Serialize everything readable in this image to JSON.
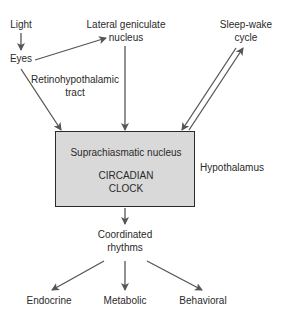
{
  "diagram": {
    "nodes": {
      "light": "Light",
      "eyes": "Eyes",
      "lgn_line1": "Lateral geniculate",
      "lgn_line2": "nucleus",
      "sleep_line1": "Sleep-wake",
      "sleep_line2": "cycle",
      "rht_line1": "Retinohypothalamic",
      "rht_line2": "tract",
      "scn": "Suprachiasmatic nucleus",
      "clock_line1": "CIRCADIAN",
      "clock_line2": "CLOCK",
      "hypothalamus": "Hypothalamus",
      "coord_line1": "Coordinated",
      "coord_line2": "rhythms",
      "endocrine": "Endocrine",
      "metabolic": "Metabolic",
      "behavioral": "Behavioral"
    },
    "edges": [
      {
        "from": "Light",
        "to": "Eyes"
      },
      {
        "from": "Eyes",
        "to": "Lateral geniculate nucleus"
      },
      {
        "from": "Eyes",
        "to": "Suprachiasmatic nucleus",
        "label": "Retinohypothalamic tract"
      },
      {
        "from": "Lateral geniculate nucleus",
        "to": "Suprachiasmatic nucleus"
      },
      {
        "from": "Sleep-wake cycle",
        "to": "Suprachiasmatic nucleus"
      },
      {
        "from": "Suprachiasmatic nucleus",
        "to": "Sleep-wake cycle"
      },
      {
        "from": "Suprachiasmatic nucleus",
        "to": "Coordinated rhythms"
      },
      {
        "from": "Coordinated rhythms",
        "to": "Endocrine"
      },
      {
        "from": "Coordinated rhythms",
        "to": "Metabolic"
      },
      {
        "from": "Coordinated rhythms",
        "to": "Behavioral"
      }
    ],
    "colors": {
      "box_fill": "#d9d9d9",
      "line": "#555555",
      "text": "#2a2a2a"
    }
  }
}
